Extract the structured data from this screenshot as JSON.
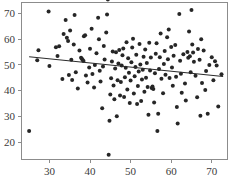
{
  "chart_data": {
    "type": "scatter",
    "title": "",
    "subtitle": "",
    "xlabel": "",
    "ylabel": "",
    "xlim": [
      23.0,
      74.0
    ],
    "ylim": [
      13.0,
      74.5
    ],
    "xticks": [
      30,
      40,
      50,
      60,
      70
    ],
    "yticks": [
      20,
      30,
      40,
      50,
      60,
      70
    ],
    "xtick_labels": [
      "30",
      "40",
      "50",
      "60",
      "70"
    ],
    "ytick_labels": [
      "20",
      "30",
      "40",
      "50",
      "60",
      "70"
    ],
    "grid": false,
    "legend": null,
    "legend_position": "none",
    "marker": "filled-circle",
    "marker_color": "#262626",
    "marker_size": 2.0,
    "frame": "box",
    "series": [
      {
        "name": "observations",
        "points": [
          [
            25.0,
            24.3
          ],
          [
            27.0,
            51.8
          ],
          [
            27.3,
            55.7
          ],
          [
            29.8,
            70.8
          ],
          [
            30.0,
            49.6
          ],
          [
            31.6,
            56.9
          ],
          [
            32.4,
            57.3
          ],
          [
            32.0,
            53.5
          ],
          [
            33.2,
            44.5
          ],
          [
            33.5,
            62.0
          ],
          [
            34.0,
            67.5
          ],
          [
            34.3,
            60.6
          ],
          [
            34.6,
            59.3
          ],
          [
            34.8,
            46.1
          ],
          [
            35.1,
            63.4
          ],
          [
            35.4,
            52.0
          ],
          [
            35.6,
            44.1
          ],
          [
            36.2,
            69.4
          ],
          [
            36.0,
            58.0
          ],
          [
            36.5,
            47.2
          ],
          [
            37.0,
            40.8
          ],
          [
            37.4,
            55.6
          ],
          [
            37.8,
            52.8
          ],
          [
            38.0,
            52.4
          ],
          [
            38.2,
            51.9
          ],
          [
            38.4,
            51.5
          ],
          [
            38.5,
            61.2
          ],
          [
            38.8,
            61.6
          ],
          [
            39.0,
            45.9
          ],
          [
            39.4,
            43.2
          ],
          [
            39.8,
            49.0
          ],
          [
            40.0,
            56.3
          ],
          [
            40.4,
            64.1
          ],
          [
            40.6,
            46.5
          ],
          [
            41.0,
            41.2
          ],
          [
            41.2,
            50.0
          ],
          [
            41.6,
            54.6
          ],
          [
            42.0,
            68.4
          ],
          [
            42.2,
            60.0
          ],
          [
            42.4,
            47.7
          ],
          [
            42.6,
            43.6
          ],
          [
            43.0,
            33.1
          ],
          [
            43.2,
            49.4
          ],
          [
            43.4,
            57.4
          ],
          [
            43.6,
            52.1
          ],
          [
            44.0,
            62.6
          ],
          [
            44.2,
            69.6
          ],
          [
            44.4,
            75.5
          ],
          [
            44.6,
            15.0
          ],
          [
            44.8,
            28.3
          ],
          [
            45.0,
            38.5
          ],
          [
            45.2,
            44.8
          ],
          [
            45.4,
            51.3
          ],
          [
            45.6,
            55.2
          ],
          [
            45.8,
            42.0
          ],
          [
            46.0,
            36.6
          ],
          [
            46.2,
            48.6
          ],
          [
            46.4,
            54.9
          ],
          [
            46.6,
            30.0
          ],
          [
            46.8,
            44.0
          ],
          [
            47.0,
            50.6
          ],
          [
            47.2,
            55.8
          ],
          [
            47.4,
            38.1
          ],
          [
            47.6,
            43.4
          ],
          [
            47.8,
            49.8
          ],
          [
            48.0,
            53.8
          ],
          [
            48.2,
            56.4
          ],
          [
            48.4,
            37.5
          ],
          [
            48.6,
            45.2
          ],
          [
            48.8,
            48.9
          ],
          [
            49.0,
            58.8
          ],
          [
            49.2,
            40.4
          ],
          [
            49.4,
            52.6
          ],
          [
            49.6,
            47.0
          ],
          [
            49.8,
            35.2
          ],
          [
            50.0,
            43.9
          ],
          [
            50.2,
            51.0
          ],
          [
            50.4,
            56.8
          ],
          [
            50.6,
            60.2
          ],
          [
            50.8,
            38.9
          ],
          [
            51.0,
            45.6
          ],
          [
            51.2,
            49.2
          ],
          [
            51.4,
            54.0
          ],
          [
            51.6,
            34.8
          ],
          [
            51.8,
            41.8
          ],
          [
            52.0,
            47.4
          ],
          [
            52.2,
            58.2
          ],
          [
            52.4,
            50.2
          ],
          [
            52.6,
            36.0
          ],
          [
            52.8,
            44.3
          ],
          [
            53.0,
            48.1
          ],
          [
            53.2,
            53.2
          ],
          [
            53.4,
            39.6
          ],
          [
            53.6,
            56.0
          ],
          [
            53.8,
            45.0
          ],
          [
            54.0,
            50.8
          ],
          [
            54.2,
            41.4
          ],
          [
            54.4,
            30.6
          ],
          [
            54.6,
            58.6
          ],
          [
            54.8,
            47.8
          ],
          [
            55.0,
            52.9
          ],
          [
            55.2,
            41.0
          ],
          [
            55.4,
            41.6
          ],
          [
            55.6,
            40.6
          ],
          [
            55.8,
            35.4
          ],
          [
            56.0,
            46.8
          ],
          [
            56.2,
            54.4
          ],
          [
            56.4,
            58.4
          ],
          [
            56.6,
            24.3
          ],
          [
            56.8,
            31.0
          ],
          [
            57.0,
            48.4
          ],
          [
            57.2,
            53.0
          ],
          [
            57.4,
            62.2
          ],
          [
            57.6,
            44.6
          ],
          [
            58.0,
            39.0
          ],
          [
            58.2,
            50.4
          ],
          [
            58.4,
            55.4
          ],
          [
            58.6,
            46.2
          ],
          [
            59.0,
            60.8
          ],
          [
            59.2,
            52.2
          ],
          [
            59.4,
            63.8
          ],
          [
            59.6,
            44.9
          ],
          [
            60.0,
            57.0
          ],
          [
            60.2,
            49.0
          ],
          [
            60.4,
            41.9
          ],
          [
            60.6,
            53.6
          ],
          [
            61.0,
            57.8
          ],
          [
            61.2,
            45.4
          ],
          [
            61.4,
            33.6
          ],
          [
            61.6,
            27.2
          ],
          [
            62.0,
            69.8
          ],
          [
            62.2,
            51.6
          ],
          [
            62.4,
            46.6
          ],
          [
            62.6,
            39.2
          ],
          [
            63.0,
            54.2
          ],
          [
            63.4,
            42.8
          ],
          [
            63.6,
            36.2
          ],
          [
            64.0,
            55.0
          ],
          [
            64.2,
            52.8
          ],
          [
            64.4,
            63.0
          ],
          [
            64.6,
            53.4
          ],
          [
            64.8,
            47.2
          ],
          [
            65.0,
            71.4
          ],
          [
            65.2,
            58.0
          ],
          [
            65.4,
            54.8
          ],
          [
            65.6,
            51.2
          ],
          [
            66.0,
            45.8
          ],
          [
            66.4,
            37.4
          ],
          [
            66.6,
            56.2
          ],
          [
            67.0,
            52.0
          ],
          [
            67.2,
            30.2
          ],
          [
            67.4,
            60.0
          ],
          [
            67.6,
            43.0
          ],
          [
            68.0,
            55.6
          ],
          [
            68.4,
            40.2
          ],
          [
            68.6,
            47.6
          ],
          [
            69.0,
            31.0
          ],
          [
            69.4,
            50.0
          ],
          [
            70.0,
            53.0
          ],
          [
            70.4,
            44.0
          ],
          [
            70.8,
            51.4
          ],
          [
            71.2,
            49.8
          ],
          [
            71.6,
            33.8
          ],
          [
            72.4,
            46.4
          ]
        ]
      }
    ],
    "fit_line": {
      "name": "least-squares-fit",
      "x_start": 25.0,
      "y_start": 53.2,
      "x_end": 72.8,
      "y_end": 45.5,
      "slope": -0.161,
      "intercept": 57.23,
      "color": "#2b2b2b"
    }
  }
}
